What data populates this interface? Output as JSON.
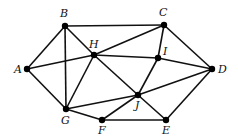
{
  "graph": {
    "nodes": [
      {
        "id": "A",
        "x": 27,
        "y": 69,
        "lx": 14,
        "ly": 73
      },
      {
        "id": "B",
        "x": 65,
        "y": 26,
        "lx": 60,
        "ly": 17
      },
      {
        "id": "C",
        "x": 164,
        "y": 25,
        "lx": 159,
        "ly": 16
      },
      {
        "id": "D",
        "x": 212,
        "y": 69,
        "lx": 218,
        "ly": 73
      },
      {
        "id": "E",
        "x": 166,
        "y": 120,
        "lx": 162,
        "ly": 134
      },
      {
        "id": "F",
        "x": 102,
        "y": 120,
        "lx": 98,
        "ly": 134
      },
      {
        "id": "G",
        "x": 66,
        "y": 109,
        "lx": 61,
        "ly": 124
      },
      {
        "id": "H",
        "x": 94,
        "y": 55,
        "lx": 89,
        "ly": 48
      },
      {
        "id": "I",
        "x": 158,
        "y": 58,
        "lx": 163,
        "ly": 55
      },
      {
        "id": "J",
        "x": 138,
        "y": 95,
        "lx": 135,
        "ly": 109
      }
    ],
    "edges": [
      [
        "A",
        "B"
      ],
      [
        "A",
        "H"
      ],
      [
        "A",
        "G"
      ],
      [
        "B",
        "C"
      ],
      [
        "B",
        "H"
      ],
      [
        "B",
        "G"
      ],
      [
        "C",
        "H"
      ],
      [
        "C",
        "I"
      ],
      [
        "C",
        "D"
      ],
      [
        "H",
        "I"
      ],
      [
        "H",
        "G"
      ],
      [
        "H",
        "J"
      ],
      [
        "I",
        "D"
      ],
      [
        "I",
        "J"
      ],
      [
        "D",
        "J"
      ],
      [
        "D",
        "E"
      ],
      [
        "G",
        "J"
      ],
      [
        "G",
        "F"
      ],
      [
        "F",
        "J"
      ],
      [
        "F",
        "E"
      ],
      [
        "J",
        "E"
      ]
    ]
  }
}
